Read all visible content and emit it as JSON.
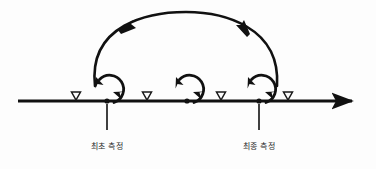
{
  "figure": {
    "type": "process-cycle-timeline-diagram",
    "background_color": "#fdfdfd",
    "stroke_color": "#111111",
    "width": 376,
    "height": 169
  },
  "axis": {
    "name": "time-axis",
    "y": 101,
    "x_start": 18,
    "x_end": 358,
    "stroke_width": 3.2,
    "arrow_end": "right"
  },
  "triangles": [
    {
      "label": "marker-1",
      "x": 76,
      "y": 97,
      "size": 9
    },
    {
      "label": "marker-2",
      "x": 147,
      "y": 97,
      "size": 9
    },
    {
      "label": "marker-3",
      "x": 221,
      "y": 97,
      "size": 9
    },
    {
      "label": "marker-4",
      "x": 288,
      "y": 97,
      "size": 9
    }
  ],
  "loops": [
    {
      "label": "loop-1",
      "cx": 107,
      "cy": 89,
      "r": 14
    },
    {
      "label": "loop-2",
      "cx": 187,
      "cy": 89,
      "r": 14
    },
    {
      "label": "loop-3",
      "cx": 259,
      "cy": 89,
      "r": 14
    }
  ],
  "nodes": [
    {
      "label": "node-first-measurement",
      "x": 107,
      "y": 101
    },
    {
      "label": "node-middle",
      "x": 187,
      "y": 101
    },
    {
      "label": "node-final-measurement",
      "x": 259,
      "y": 101
    }
  ],
  "arc": {
    "label": "return-arc",
    "from_x": 95,
    "from_y": 86,
    "to_x": 277,
    "to_y": 86,
    "apex_y": 14,
    "arrowheads": [
      {
        "label": "arc-arrow-left",
        "x": 128,
        "y": 27
      },
      {
        "label": "arc-arrow-right",
        "x": 243,
        "y": 25
      }
    ]
  },
  "leaders": [
    {
      "label": "leader-first",
      "x": 107,
      "y_top": 104,
      "y_bottom": 130
    },
    {
      "label": "leader-final",
      "x": 259,
      "y_top": 104,
      "y_bottom": 130
    }
  ],
  "labels": {
    "first_measurement": "최초 측정",
    "final_measurement": "최종 측정"
  }
}
